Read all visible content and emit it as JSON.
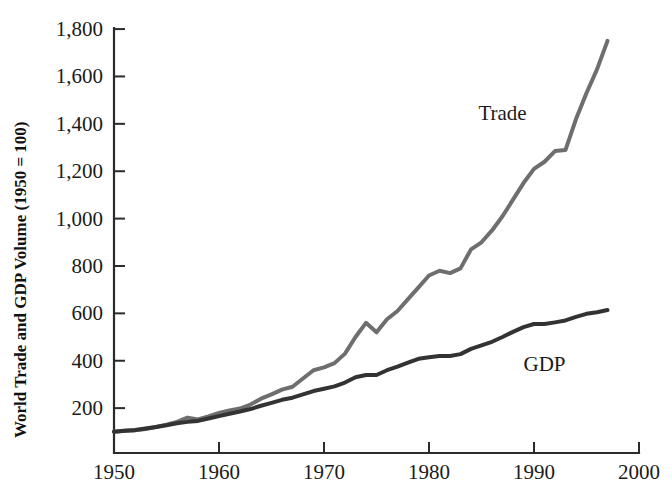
{
  "chart_data": {
    "type": "line",
    "title": "",
    "xlabel": "",
    "ylabel": "World Trade and GDP Volume (1950 = 100)",
    "xlim": [
      1950,
      2000
    ],
    "ylim": [
      0,
      1900
    ],
    "grid": false,
    "legend_position": "inline-annotation",
    "x_ticks": [
      "1950",
      "1960",
      "1970",
      "1980",
      "1990",
      "2000"
    ],
    "x_tick_values": [
      1950,
      1960,
      1970,
      1980,
      1990,
      2000
    ],
    "y_ticks": [
      "200",
      "400",
      "600",
      "800",
      "1,000",
      "1,200",
      "1,400",
      "1,600",
      "1,800"
    ],
    "y_tick_values": [
      200,
      400,
      600,
      800,
      1000,
      1200,
      1400,
      1600,
      1800
    ],
    "x": [
      1950,
      1951,
      1952,
      1953,
      1954,
      1955,
      1956,
      1957,
      1958,
      1959,
      1960,
      1961,
      1962,
      1963,
      1964,
      1965,
      1966,
      1967,
      1968,
      1969,
      1970,
      1971,
      1972,
      1973,
      1974,
      1975,
      1976,
      1977,
      1978,
      1979,
      1980,
      1981,
      1982,
      1983,
      1984,
      1985,
      1986,
      1987,
      1988,
      1989,
      1990,
      1991,
      1992,
      1993,
      1994,
      1995,
      1996,
      1997
    ],
    "series": [
      {
        "name": "Trade",
        "color": "#6e6e6e",
        "label_x": 1987,
        "label_y": 1415,
        "values": [
          100,
          104,
          106,
          112,
          120,
          130,
          142,
          160,
          152,
          165,
          180,
          190,
          198,
          215,
          240,
          258,
          278,
          290,
          325,
          360,
          372,
          390,
          430,
          500,
          560,
          520,
          575,
          610,
          660,
          710,
          760,
          780,
          770,
          790,
          870,
          900,
          950,
          1010,
          1080,
          1150,
          1210,
          1240,
          1285,
          1290,
          1420,
          1530,
          1630,
          1750
        ]
      },
      {
        "name": "GDP",
        "color": "#333333",
        "label_x": 1991,
        "label_y": 355,
        "values": [
          100,
          104,
          108,
          114,
          120,
          128,
          136,
          142,
          146,
          156,
          166,
          176,
          186,
          196,
          210,
          222,
          235,
          244,
          258,
          272,
          282,
          292,
          308,
          330,
          340,
          340,
          360,
          375,
          392,
          408,
          415,
          420,
          420,
          428,
          450,
          465,
          480,
          500,
          522,
          542,
          555,
          555,
          562,
          570,
          585,
          598,
          605,
          614
        ]
      }
    ],
    "annotations": [
      {
        "text": "Trade",
        "x": 1987,
        "y": 1415
      },
      {
        "text": "GDP",
        "x": 1991,
        "y": 355
      }
    ]
  },
  "geometry": {
    "plot_left": 114,
    "plot_right": 639,
    "plot_bottom": 453,
    "y_zero_px": 455.5,
    "y_px_per_unit": 0.2369
  }
}
